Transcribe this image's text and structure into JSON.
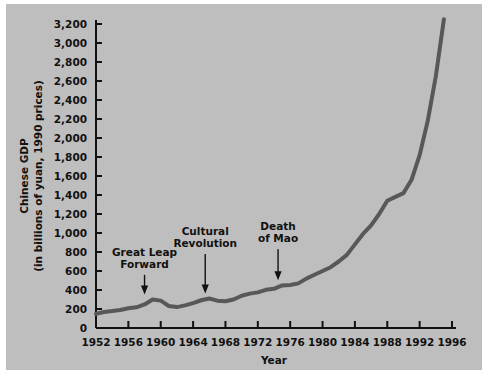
{
  "chart_data": {
    "type": "line",
    "title": "",
    "xlabel": "Year",
    "ylabel": "Chinese GDP (in billions of yuan, 1990 prices)",
    "ylabel_line1": "Chinese GDP",
    "ylabel_line2": "(in billions of yuan, 1990 prices)",
    "xlim": [
      1952,
      1996
    ],
    "ylim": [
      0,
      3200
    ],
    "grid": false,
    "legend": null,
    "line_color": "#585858",
    "background_color": "#bebebe",
    "text_color": "#111111",
    "xticks": [
      "1952",
      "1956",
      "1960",
      "1964",
      "1968",
      "1972",
      "1976",
      "1980",
      "1984",
      "1988",
      "1992",
      "1996"
    ],
    "yticks": [
      "0",
      "200",
      "400",
      "600",
      "800",
      "1,000",
      "1,200",
      "1,400",
      "1,600",
      "1,800",
      "2,000",
      "2,200",
      "2,400",
      "2,600",
      "2,800",
      "3,000",
      "3,200"
    ],
    "x": [
      1952,
      1953,
      1954,
      1955,
      1956,
      1957,
      1958,
      1959,
      1960,
      1961,
      1962,
      1963,
      1964,
      1965,
      1966,
      1967,
      1968,
      1969,
      1970,
      1971,
      1972,
      1973,
      1974,
      1975,
      1976,
      1977,
      1978,
      1979,
      1980,
      1981,
      1982,
      1983,
      1984,
      1985,
      1986,
      1987,
      1988,
      1989,
      1990,
      1991,
      1992,
      1993,
      1994,
      1995
    ],
    "values": [
      150,
      168,
      178,
      190,
      208,
      218,
      248,
      300,
      288,
      232,
      220,
      238,
      262,
      292,
      310,
      288,
      282,
      300,
      340,
      362,
      375,
      402,
      412,
      448,
      452,
      470,
      520,
      560,
      600,
      640,
      700,
      770,
      880,
      990,
      1080,
      1200,
      1340,
      1380,
      1420,
      1560,
      1820,
      2180,
      2650,
      3250
    ],
    "series_name": "Chinese GDP",
    "annotations": [
      {
        "label_line1": "Great Leap",
        "label_line2": "Forward",
        "x": 1958.0,
        "y": 290,
        "label_x": 1958.0,
        "label_y": 760
      },
      {
        "label_line1": "Cultural",
        "label_line2": "Revolution",
        "x": 1965.5,
        "y": 300,
        "label_x": 1965.5,
        "label_y": 980
      },
      {
        "label_line1": "Death",
        "label_line2": "of Mao",
        "x": 1974.5,
        "y": 440,
        "label_x": 1974.5,
        "label_y": 1030
      }
    ]
  }
}
